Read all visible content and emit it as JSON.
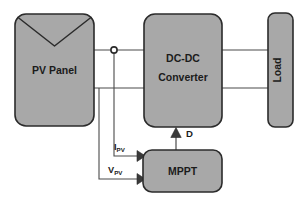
{
  "diagram": {
    "colors": {
      "block_fill": "#a8a8a8",
      "block_stroke": "#2b2b2b",
      "wire": "#4a4a4a",
      "text": "#1b1b1b",
      "background": "#ffffff"
    },
    "blocks": {
      "pv_panel": {
        "label": "PV Panel"
      },
      "dcdc": {
        "label_line1": "DC-DC",
        "label_line2": "Converter"
      },
      "load": {
        "label": "Load"
      },
      "mppt": {
        "label": "MPPT"
      }
    },
    "signals": {
      "current": {
        "symbol": "I",
        "subscript": "PV"
      },
      "voltage": {
        "symbol": "V",
        "subscript": "PV"
      },
      "duty": {
        "label": "D"
      }
    },
    "node": {
      "name": "junction-node"
    }
  }
}
